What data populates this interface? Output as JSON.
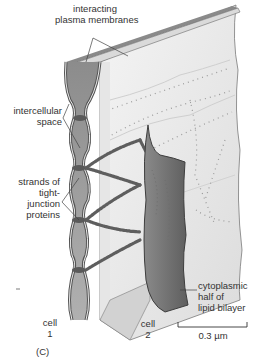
{
  "figure": {
    "panel_label": "(C)",
    "labels": {
      "membranes_line1": "interacting",
      "membranes_line2": "plasma membranes",
      "space_line1": "intercellular",
      "space_line2": "space",
      "strands_line1": "strands of",
      "strands_line2": "tight-",
      "strands_line3": "junction",
      "strands_line4": "proteins",
      "cyto_line1": "cytoplasmic",
      "cyto_line2": "half of",
      "cyto_line3": "lipid bilayer",
      "cell1_line1": "cell",
      "cell1_line2": "1",
      "cell2_line1": "cell",
      "cell2_line2": "2",
      "scale": "0.3 µm"
    },
    "colors": {
      "membrane": "#5a5a5a",
      "membrane_light": "#d8d8d8",
      "space": "#9a9a9a",
      "sheet": "#ececec",
      "strand": "#6a6a6a",
      "cyto": "#7a7a7a"
    }
  }
}
